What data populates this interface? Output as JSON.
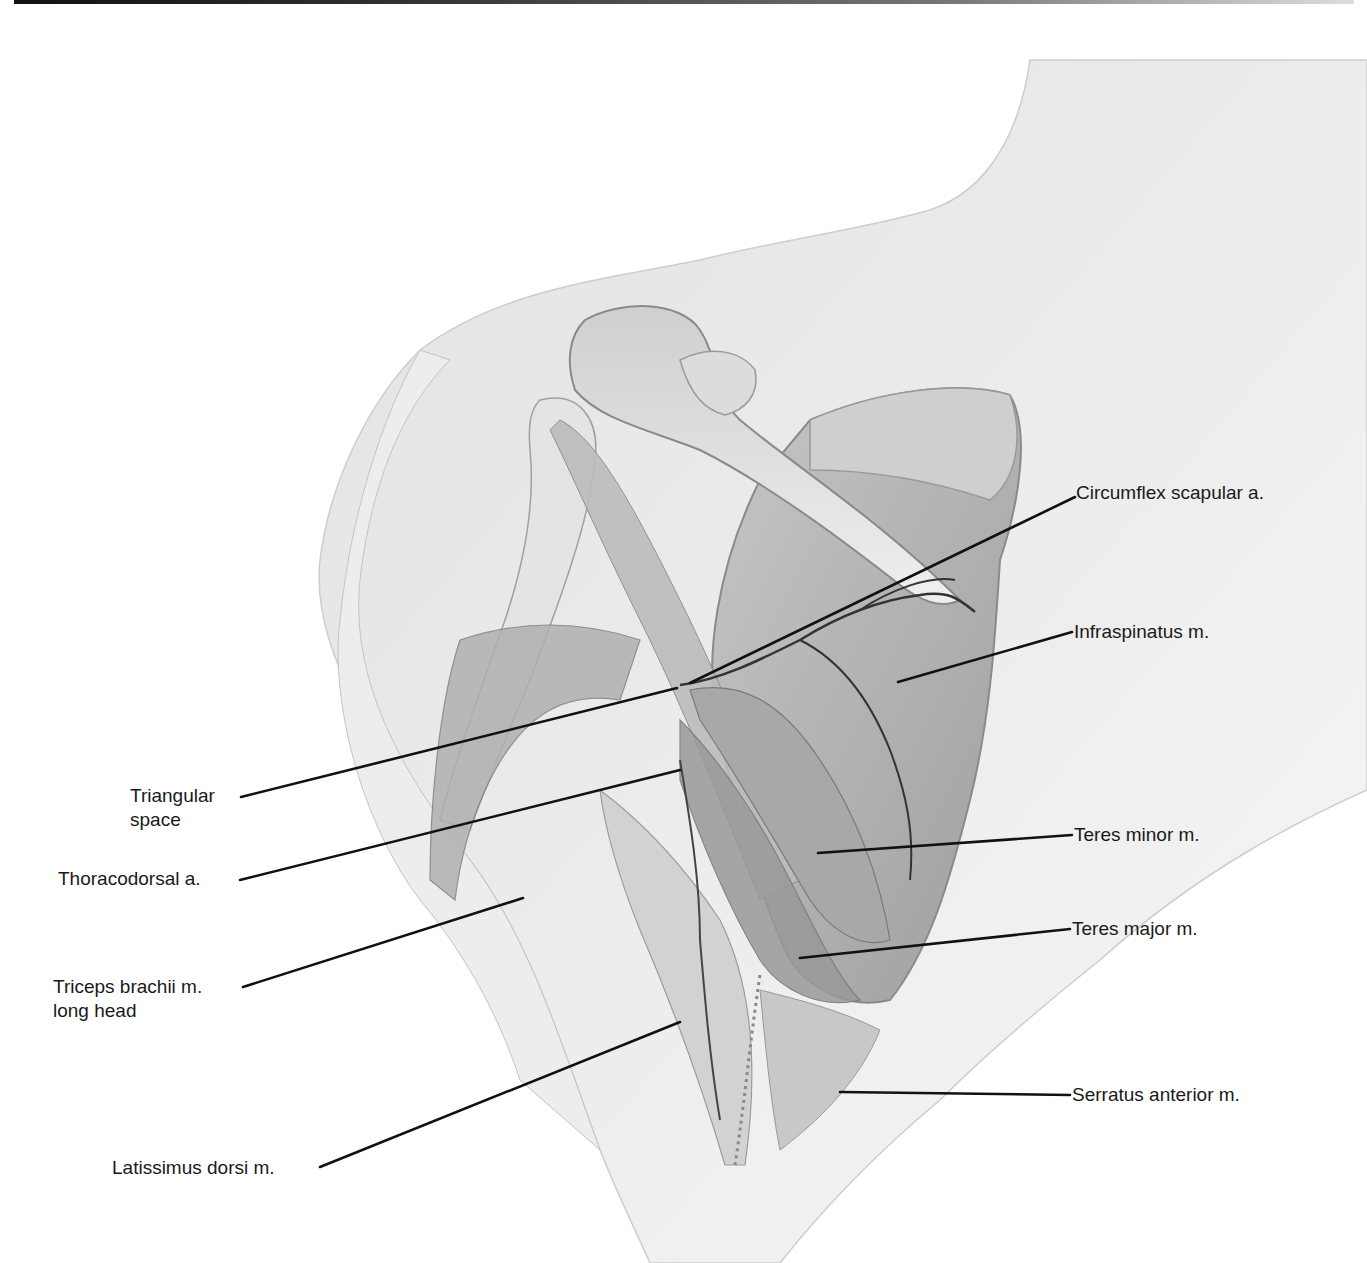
{
  "figure": {
    "labels": {
      "circumflex_scapular": "Circumflex scapular a.",
      "infraspinatus": "Infraspinatus m.",
      "triangular_space_line1": "Triangular",
      "triangular_space_line2": "space",
      "thoracodorsal": "Thoracodorsal a.",
      "teres_minor": "Teres minor m.",
      "teres_major": "Teres major m.",
      "triceps_line1": "Triceps brachii m.",
      "triceps_line2": "long head",
      "serratus_anterior": "Serratus anterior m.",
      "latissimus_dorsi": "Latissimus dorsi m."
    },
    "colors": {
      "background": "#ffffff",
      "leader_line": "#111111",
      "skin_shade": "#e6e6e6",
      "muscle_shade": "#b8b8b8",
      "vessel": "#333333"
    }
  }
}
